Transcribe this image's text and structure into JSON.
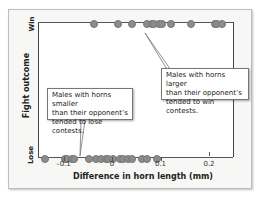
{
  "chart_data": {
    "type": "scatter",
    "title": "",
    "xlabel": "Difference in horn length (mm)",
    "ylabel": "Fight outcome",
    "xlim": [
      -0.155,
      0.245
    ],
    "x_ticks": [
      -0.1,
      0,
      0.1,
      0.2
    ],
    "x_tick_labels": [
      "–0.1",
      "0",
      "0.1",
      "0.2"
    ],
    "y_categories": [
      "Lose",
      "Win"
    ],
    "grid": false,
    "series": [
      {
        "name": "Win",
        "y": "Win",
        "x": [
          -0.04,
          0.01,
          0.04,
          0.07,
          0.08,
          0.085,
          0.095,
          0.1,
          0.12,
          0.16,
          0.21,
          0.215,
          0.225
        ]
      },
      {
        "name": "Lose",
        "y": "Lose",
        "x": [
          -0.14,
          -0.1,
          -0.095,
          -0.085,
          -0.08,
          -0.05,
          -0.035,
          -0.025,
          -0.015,
          -0.01,
          0.0,
          0.015,
          0.02,
          0.03,
          0.04,
          0.06,
          0.07,
          0.09
        ]
      }
    ],
    "annotations": [
      {
        "text": "Males with horns larger than their opponent's tended to win contests.",
        "points_to": "Win row"
      },
      {
        "text": "Males with horns smaller than their opponent's tended to lose contests.",
        "points_to": "Lose row"
      }
    ]
  },
  "labels": {
    "y_win": "Win",
    "y_lose": "Lose",
    "y_title": "Fight outcome",
    "x_title": "Difference in horn length (mm)",
    "ticks": [
      "–0.1",
      "0",
      "0.1",
      "0.2"
    ]
  },
  "callouts": {
    "larger": [
      "Males with horns larger",
      "than their opponent’s",
      "tended to win contests."
    ],
    "smaller": [
      "Males with horns smaller",
      "than their opponent’s",
      "tended to lose contests."
    ]
  },
  "colors": {
    "dot": "#8c8c8c",
    "line": "#555555",
    "frame_bg": "#f7f7f5"
  }
}
